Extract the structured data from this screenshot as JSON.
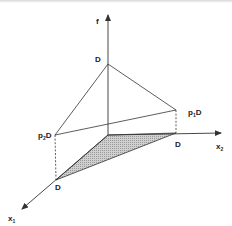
{
  "diagram": {
    "axes": {
      "vertical": {
        "label": "f"
      },
      "right": {
        "label": "x",
        "subscript": "2"
      },
      "front": {
        "label": "x",
        "subscript": "1"
      }
    },
    "points": {
      "apex": {
        "label": "D"
      },
      "upper_right": {
        "label_main": "p",
        "label_sub": "1",
        "label_tail": "D"
      },
      "upper_left": {
        "label_main": "p",
        "label_sub": "2",
        "label_tail": "D"
      },
      "base_right": {
        "label": "D"
      },
      "base_front": {
        "label": "D"
      }
    },
    "shaded_region": {
      "fill": "#bdbdbd",
      "description": "base triangle in x1-x2 plane"
    },
    "colors": {
      "line": "#333333",
      "shade": "#bdbdbd",
      "background": "#ffffff"
    }
  }
}
